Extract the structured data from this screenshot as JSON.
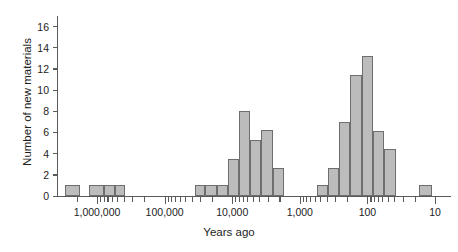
{
  "chart_data": {
    "type": "bar",
    "title": "",
    "subtitle": "",
    "xlabel": "Years ago",
    "ylabel": "Number of new materials",
    "x_scale": "log-reversed",
    "grid": false,
    "legend": null,
    "ylim": [
      0,
      17
    ],
    "y_ticks": [
      0,
      2,
      4,
      6,
      8,
      10,
      12,
      14,
      16
    ],
    "y_tick_labels": [
      "0",
      "2",
      "4",
      "6",
      "8",
      "10",
      "12",
      "14",
      "16"
    ],
    "x_major_ticks": [
      1000000,
      100000,
      10000,
      1000,
      100,
      10
    ],
    "x_tick_labels": [
      "1,000,000",
      "100,000",
      "10,000",
      "1,000",
      "100",
      "10"
    ],
    "x_range_left": 3000000,
    "x_range_right": 7,
    "bar_fill": "#bcbcbc",
    "bar_edge": "#6e6e6e",
    "axis_color": "#5a5a5a",
    "text_color": "#1d1d1d",
    "background": "#ffffff",
    "bins": [
      {
        "x_left": 3000000,
        "x_right": 1800000,
        "value": 1
      },
      {
        "x_left": 1300000,
        "x_right": 800000,
        "value": 1
      },
      {
        "x_left": 800000,
        "x_right": 550000,
        "value": 1
      },
      {
        "x_left": 550000,
        "x_right": 380000,
        "value": 1
      },
      {
        "x_left": 36000,
        "x_right": 25000,
        "value": 1
      },
      {
        "x_left": 25000,
        "x_right": 17000,
        "value": 1
      },
      {
        "x_left": 17000,
        "x_right": 11500,
        "value": 1
      },
      {
        "x_left": 11500,
        "x_right": 8000,
        "value": 3.5
      },
      {
        "x_left": 8000,
        "x_right": 5400,
        "value": 8
      },
      {
        "x_left": 5400,
        "x_right": 3700,
        "value": 5.3
      },
      {
        "x_left": 3700,
        "x_right": 2500,
        "value": 6.2
      },
      {
        "x_left": 2500,
        "x_right": 1700,
        "value": 2.6
      },
      {
        "x_left": 560,
        "x_right": 380,
        "value": 1
      },
      {
        "x_left": 380,
        "x_right": 260,
        "value": 2.6
      },
      {
        "x_left": 260,
        "x_right": 180,
        "value": 7
      },
      {
        "x_left": 180,
        "x_right": 120,
        "value": 11.4
      },
      {
        "x_left": 120,
        "x_right": 82,
        "value": 13.2
      },
      {
        "x_left": 82,
        "x_right": 56,
        "value": 6.1
      },
      {
        "x_left": 56,
        "x_right": 38,
        "value": 4.4
      },
      {
        "x_left": 17,
        "x_right": 11,
        "value": 1
      }
    ],
    "values": [
      1,
      1,
      1,
      1,
      1,
      1,
      1,
      3.5,
      8,
      5.3,
      6.2,
      2.6,
      1,
      2.6,
      7,
      11.4,
      13.2,
      6.1,
      4.4,
      1
    ],
    "categories": [
      "3.0M-1.8M",
      "1.3M-800k",
      "800k-550k",
      "550k-380k",
      "36k-25k",
      "25k-17k",
      "17k-11.5k",
      "11.5k-8k",
      "8k-5.4k",
      "5.4k-3.7k",
      "3.7k-2.5k",
      "2.5k-1.7k",
      "560-380",
      "380-260",
      "260-180",
      "180-120",
      "120-82",
      "82-56",
      "56-38",
      "17-11"
    ],
    "minor_ticks": [
      2000000,
      900000,
      800000,
      700000,
      600000,
      500000,
      400000,
      300000,
      200000,
      90000,
      80000,
      70000,
      60000,
      50000,
      40000,
      30000,
      20000,
      9000,
      8000,
      7000,
      6000,
      5000,
      4000,
      3000,
      2000,
      900,
      800,
      700,
      600,
      500,
      400,
      300,
      200,
      90,
      80,
      70,
      60,
      50,
      40,
      30,
      20
    ]
  }
}
